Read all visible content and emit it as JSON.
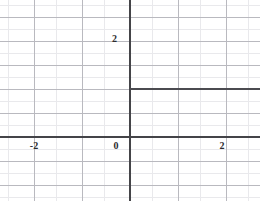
{
  "figure": {
    "width": 260,
    "height": 201,
    "background": "#ffffff"
  },
  "colors": {
    "minor_grid": "#e9e9ec",
    "major_grid": "#b9b9bf",
    "axis": "#444448",
    "curve": "#4b4b50",
    "label_text": "#2b2b2e"
  },
  "axes": {
    "x_axis_name": "x-axis",
    "y_axis_name": "y-axis",
    "origin_px": {
      "x": 130,
      "y": 137
    },
    "unit_px": 48,
    "minor_step_px": 24
  },
  "labels": {
    "x": [
      {
        "text": "-2",
        "value": -2,
        "px_x": 34,
        "px_y": 141
      },
      {
        "text": "0",
        "value": 0,
        "px_x": 116,
        "px_y": 141
      },
      {
        "text": "2",
        "value": 2,
        "px_x": 222,
        "px_y": 141
      }
    ],
    "y": [
      {
        "text": "2",
        "value": 2,
        "px_x": 117,
        "px_y": 34
      }
    ]
  },
  "chart_data": {
    "type": "line",
    "title": "",
    "subtitle": "",
    "xlabel": "",
    "ylabel": "",
    "xlim": [
      -2.7,
      2.7
    ],
    "ylim": [
      -0.85,
      3.4
    ],
    "xticks": [
      -2,
      0,
      2
    ],
    "xtick_labels": [
      "-2",
      "0",
      "2"
    ],
    "yticks": [
      2
    ],
    "ytick_labels": [
      "2"
    ],
    "grid": true,
    "grid_major_step": 1,
    "grid_minor_step": 0.5,
    "legend": null,
    "legend_position": "none",
    "annotations": [],
    "series": [
      {
        "name": "step-branch-left",
        "type": "line",
        "points": [
          [
            -2.7,
            0
          ],
          [
            0,
            0
          ]
        ],
        "color": "#4b4b50",
        "linewidth": 2
      },
      {
        "name": "step-branch-right",
        "type": "line",
        "points": [
          [
            0,
            1
          ],
          [
            2.7,
            1
          ]
        ],
        "color": "#4b4b50",
        "linewidth": 2
      }
    ]
  },
  "geometry": {
    "minor_h_px": [
      5,
      29,
      53,
      77,
      101,
      125,
      149,
      173,
      197
    ],
    "minor_v_px": [
      8,
      56,
      104,
      152,
      200,
      248
    ],
    "major_h_px": [
      17,
      41,
      65,
      89,
      113,
      161,
      185
    ],
    "major_v_px": [
      34,
      82,
      178,
      226
    ],
    "x_axis_px_y": 137,
    "y_axis_px_x": 130,
    "step_segment": {
      "px_y": 89,
      "px_x_start": 130,
      "px_x_end": 260
    },
    "base_segment": {
      "px_y": 137,
      "px_x_start": 0,
      "px_x_end": 260
    }
  }
}
